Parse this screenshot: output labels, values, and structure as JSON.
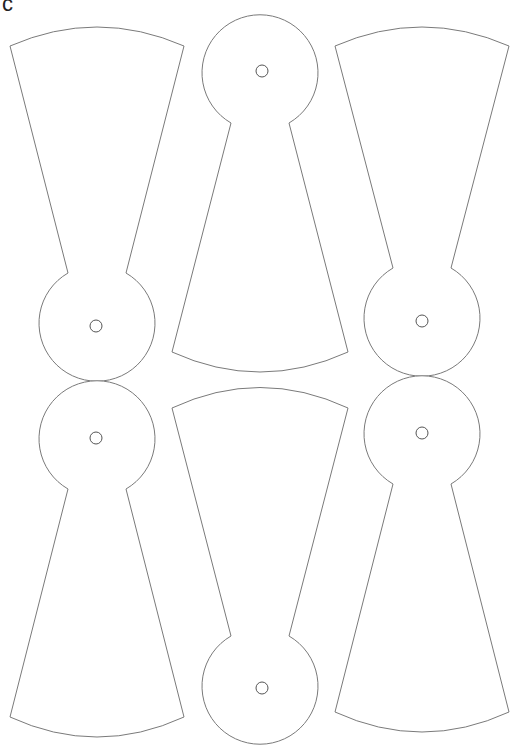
{
  "figure": {
    "label": "c",
    "stroke_color": "#7a7a7a",
    "background": "#ffffff",
    "shapes": [
      {
        "id": "shape-1",
        "row": 1,
        "col": 1,
        "orientation": "circle-bottom"
      },
      {
        "id": "shape-2",
        "row": 1,
        "col": 2,
        "orientation": "circle-top"
      },
      {
        "id": "shape-3",
        "row": 1,
        "col": 3,
        "orientation": "circle-bottom"
      },
      {
        "id": "shape-4",
        "row": 2,
        "col": 1,
        "orientation": "circle-top"
      },
      {
        "id": "shape-5",
        "row": 2,
        "col": 2,
        "orientation": "circle-bottom"
      },
      {
        "id": "shape-6",
        "row": 2,
        "col": 3,
        "orientation": "circle-top"
      }
    ]
  }
}
